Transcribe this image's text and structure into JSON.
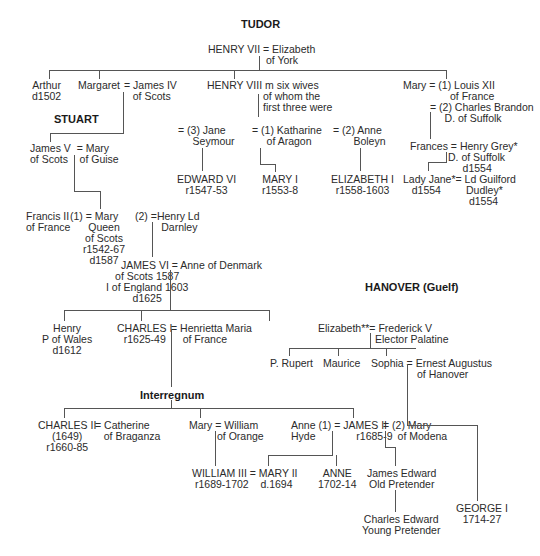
{
  "dynasties": {
    "tudor": "TUDOR",
    "stuart": "STUART",
    "interregnum": "Interregnum",
    "hanover": "HANOVER (Guelf)"
  },
  "people": {
    "henry7": "HENRY VII = Elizabeth",
    "henry7_b": "of York",
    "arthur": "Arthur\nd1502",
    "margaret": "Margaret",
    "james4": "= James IV\n   of Scots",
    "henry8": "HENRY VIII m six wives",
    "henry8_b": "of whom the\nfirst three were",
    "mary_t": "Mary = (1) Louis XII",
    "mary_t_b": "of France",
    "mary_t_c": "= (2) Charles Brandon\n     D. of Suffolk",
    "jane": "= (3) Jane\n     Seymour",
    "katharine": "= (1) Katharine\n     of Aragon",
    "anne_b": "= (2) Anne\n       Boleyn",
    "edward6": "EDWARD VI\nr1547-53",
    "mary1": "MARY I\nr1553-8",
    "elizabeth1": "ELIZABETH I\nr1558-1603",
    "frances": "Frances = Henry Grey*",
    "frances_b": "D. of Suffolk\n     d1554",
    "ladyjane": "Lady Jane*= Ld Guilford\n   d1554",
    "dudley": "Dudley*\n d1554",
    "james5": "James V  = Mary\nof Scots    of Guise",
    "francis2": "Francis II\nof France",
    "maryqs": "(1) = Mary",
    "maryqs_b": "Queen\nof Scots\nr1542-67\nd1587",
    "darnley": "(2) =Henry Ld\n         Darnley",
    "james6": "JAMES VI = Anne of Denmark",
    "james6_b": "of Scots 1587\nI of England 1603\nd1625",
    "henry_pw": "Henry\nP of Wales\nd1612",
    "charles1": "CHARLES I\nr1625-49",
    "henrietta": "= Henrietta Maria\n    of France",
    "elizabeth_p": "Elizabeth**= Frederick V",
    "elizabeth_p_b": "Elector Palatine",
    "rupert": "P. Rupert",
    "maurice": "Maurice",
    "sophia": "Sophia = Ernest Augustus",
    "sophia_b": "of Hanover",
    "charles2": "CHARLES II\n(1649)\nr1660-85",
    "catherine": "= Catherine\n   of Braganza",
    "mary_o": "Mary = William",
    "mary_o_b": "of Orange",
    "anne_hyde": "Anne (1) = JAMES II",
    "anne_hyde_b": "Hyde              r1685-9",
    "mary_mod": "= (2) Mary\n     of Modena",
    "william3": "WILLIAM III = MARY II",
    "william3_b": "r1689-1702    d.1694",
    "anne": "ANNE\n1702-14",
    "james_ed": "James Edward\nOld Pretender",
    "charles_ed": "Charles Edward\nYoung Pretender",
    "george1": "GEORGE I\n1714-27"
  }
}
